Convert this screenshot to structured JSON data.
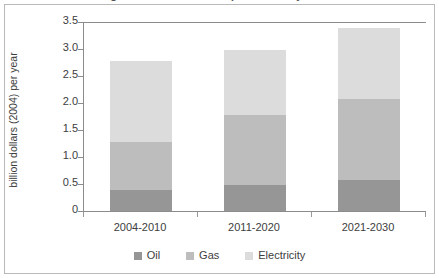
{
  "figure": {
    "title_clipped": "Figure 3.1 Investment requirements by sector",
    "border_color": "#b9b9b9",
    "axis_color": "#8c8c8c",
    "background": "#ffffff"
  },
  "chart_data": {
    "type": "bar",
    "stacked": true,
    "title": "",
    "xlabel": "",
    "ylabel": "billion dollars (2004) per year",
    "categories": [
      "2004-2010",
      "2011-2020",
      "2021-2030"
    ],
    "series": [
      {
        "name": "Oil",
        "color": "#969696",
        "values": [
          0.4,
          0.5,
          0.6
        ]
      },
      {
        "name": "Gas",
        "color": "#bdbdbd",
        "values": [
          0.9,
          1.3,
          1.5
        ]
      },
      {
        "name": "Electricity",
        "color": "#dcdcdc",
        "values": [
          1.5,
          1.2,
          1.3
        ]
      }
    ],
    "cumulative_tops": [
      {
        "category": "2004-2010",
        "oil": 0.4,
        "gas": 1.3,
        "total": 2.8
      },
      {
        "category": "2011-2020",
        "oil": 0.5,
        "gas": 1.8,
        "total": 3.0
      },
      {
        "category": "2021-2030",
        "oil": 0.6,
        "gas": 2.1,
        "total": 3.4
      }
    ],
    "ylim": [
      0,
      3.5
    ],
    "ytick_values": [
      0,
      0.5,
      1.0,
      1.5,
      2.0,
      2.5,
      3.0,
      3.5
    ],
    "ytick_labels": [
      "0",
      "0.5",
      "1.0",
      "1.5",
      "2.0",
      "2.5",
      "3.0",
      "3.5"
    ],
    "grid": false,
    "legend_position": "bottom-center",
    "legend_entries": [
      "Oil",
      "Gas",
      "Electricity"
    ]
  }
}
